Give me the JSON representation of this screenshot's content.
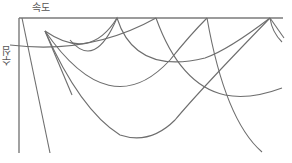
{
  "diagram": {
    "x_axis_label": "속도",
    "y_axis_label": "수심",
    "colors": {
      "stroke": "#6e6e6e",
      "axis": "#7a7a7a",
      "label": "#555555",
      "background": "#ffffff"
    },
    "axes": {
      "top": {
        "x1": 19,
        "y1": 18,
        "x2": 283,
        "y2": 18
      },
      "left": {
        "x1": 19,
        "y1": 18,
        "x2": 19,
        "y2": 153
      }
    },
    "lines": [
      {
        "name": "steep-line",
        "d": "M22,18 L50,153"
      }
    ],
    "curves": [
      {
        "name": "fan-curve-shallow",
        "d": "M45,31 Q90,62 117,18"
      },
      {
        "name": "fan-curve-mid",
        "d": "M45,31 Q110,125 170,60 Q190,35 207,18"
      },
      {
        "name": "fan-curve-deep",
        "d": "M45,31 Q80,110 120,135 Q150,145 175,120 Q200,90 270,18"
      },
      {
        "name": "fan-curve-steep",
        "d": "M45,31 L72,95"
      },
      {
        "name": "arc-117-156",
        "d": "M70,40 Q95,70 117,18 Q135,75 205,58 Q228,50 270,18"
      },
      {
        "name": "arc-156-left",
        "d": "M10,45 Q90,55 156,18"
      },
      {
        "name": "arc-156-right",
        "d": "M156,18 Q180,85 225,95 Q250,100 282,88"
      },
      {
        "name": "arc-207-down",
        "d": "M207,18 Q225,120 262,152"
      },
      {
        "name": "arc-270-tail-a",
        "d": "M270,18 L284,38"
      },
      {
        "name": "arc-270-tail-b",
        "d": "M270,18 Q272,32 282,42"
      }
    ]
  }
}
